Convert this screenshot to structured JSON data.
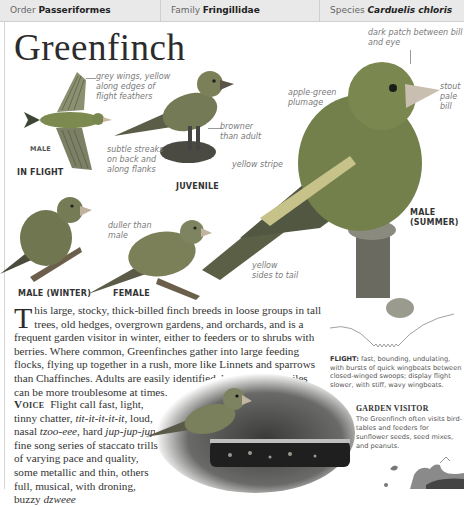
{
  "header": {
    "order_label": "Order",
    "order_value": "Passeriformes",
    "family_label": "Family",
    "family_value": "Fringillidae",
    "species_label": "Species",
    "species_value": "Carduelis chloris"
  },
  "title": "Greenfinch",
  "illustrations": {
    "in_flight": {
      "sex_label": "MALE",
      "caption": "IN FLIGHT",
      "annotation": "grey wings, yellow along edges of flight feathers"
    },
    "juvenile": {
      "caption": "JUVENILE",
      "annotations": [
        "browner than adult",
        "subtle streaks on back and along flanks"
      ]
    },
    "male_summer": {
      "caption_line1": "MALE",
      "caption_line2": "(SUMMER)",
      "annotations": {
        "dark_patch": "dark patch between bill and eye",
        "stout_bill": "stout pale bill",
        "plumage": "apple-green plumage",
        "yellow_stripe": "yellow stripe",
        "yellow_tail": "yellow sides to tail"
      }
    },
    "male_winter": {
      "caption": "MALE (WINTER)"
    },
    "female": {
      "caption": "FEMALE",
      "annotation": "duller than male"
    }
  },
  "description": {
    "dropcap": "T",
    "text": "his large, stocky, thick-billed finch breeds in loose groups in tall trees, old hedges, overgrown gardens, and orchards, and is a frequent garden visitor in winter, either to feeders or to shrubs with berries. Where common, Greenfinches gather into large feeding flocks, flying up together in a rush, more like Linnets and sparrows than Chaffinches. Adults are easily identified, but duller juveniles can be more troublesome at times."
  },
  "voice": {
    "label": "Voice",
    "text_1": "Flight call fast, light, tinny chatter, ",
    "call_1": "tit-it-it-it-it",
    "text_2": ", loud, nasal ",
    "call_2": "tzoo-eee",
    "text_3": ", hard ",
    "call_3": "jup-jup-jup",
    "text_4": "; fine song series of staccato trills of varying pace and quality, some metallic and thin, others full, musical, with droning, buzzy ",
    "call_4": "dzweee"
  },
  "flight": {
    "label": "FLIGHT:",
    "text": "fast, bounding, undulating, with bursts of quick wingbeats between closed-winged swoops; display flight slower, with stiff, wavy wingbeats."
  },
  "garden_visitor": {
    "title": "GARDEN VISITOR",
    "text": "The Greenfinch often visits bird-tables and feeders for sunflower seeds, seed mixes, and peanuts."
  },
  "colors": {
    "header_bg": "#e9e9e9",
    "bird_green": "#6f7a4a",
    "annotation_grey": "#7a7a7a"
  }
}
